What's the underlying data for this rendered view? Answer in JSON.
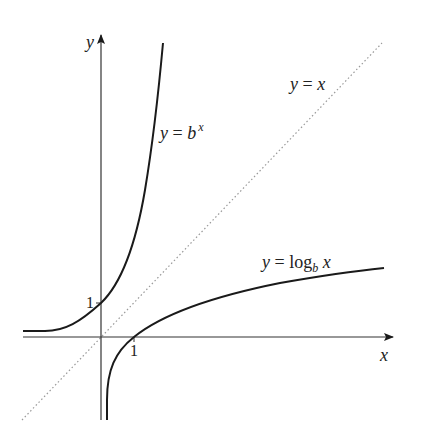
{
  "figure": {
    "labels": {
      "y_axis": "y",
      "x_axis": "x",
      "tick_y_one": "1",
      "tick_x_one": "1",
      "exp_curve": {
        "lhs": "y",
        "eq": " = ",
        "base": "b",
        "exp": "x"
      },
      "identity_line": {
        "lhs": "y",
        "eq": " = ",
        "rhs": "x"
      },
      "log_curve": {
        "lhs": "y",
        "eq": " = ",
        "fn": "log",
        "sub": "b",
        "arg": " x"
      }
    },
    "colors": {
      "curve": "#1a1a1a",
      "axis": "#333333",
      "dotted": "#999999"
    }
  }
}
